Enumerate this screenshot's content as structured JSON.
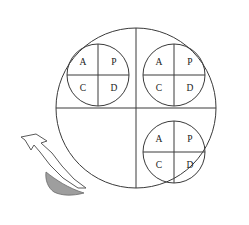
{
  "figure": {
    "title": "",
    "background_color": "#ffffff",
    "line_color": "#3a3a3a",
    "label_color": "#1a1a1a",
    "shaded_region_color": "#9e9e9e",
    "arrow_outline_color": "#5a5a5a"
  },
  "outer_circle": {
    "name": "large-circle",
    "center_x": 136,
    "center_y": 108,
    "radius": 80,
    "divider_vertical": true,
    "divider_horizontal": true
  },
  "quadrant_labels": [
    "A",
    "P",
    "C",
    "D"
  ],
  "small_circles": [
    {
      "id": "top-left",
      "center_x": 98,
      "center_y": 75,
      "radius": 31,
      "labels": {
        "top_left": "A",
        "top_right": "P",
        "bottom_left": "C",
        "bottom_right": "D"
      }
    },
    {
      "id": "top-right",
      "center_x": 174,
      "center_y": 75,
      "radius": 31,
      "labels": {
        "top_left": "A",
        "top_right": "P",
        "bottom_left": "C",
        "bottom_right": "D"
      }
    },
    {
      "id": "bottom-right",
      "center_x": 174,
      "center_y": 152,
      "radius": 31,
      "labels": {
        "top_left": "A",
        "top_right": "P",
        "bottom_left": "C",
        "bottom_right": "D"
      }
    }
  ],
  "annotation": {
    "name": "curved-arrow",
    "description": "curved arrow pointing up-left",
    "shaded_crescent": {
      "name": "shaded-crescent",
      "fill": "#9e9e9e"
    }
  }
}
